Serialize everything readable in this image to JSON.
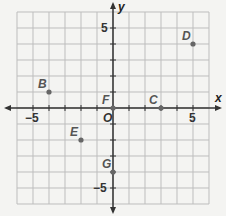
{
  "chart_data": {
    "type": "scatter",
    "title": "",
    "xlabel": "x",
    "ylabel": "y",
    "xlim": [
      -6,
      6
    ],
    "ylim": [
      -6,
      6
    ],
    "grid": true,
    "origin_label": "O",
    "x_tick_labels": [
      {
        "value": -5,
        "label": "−5"
      },
      {
        "value": 5,
        "label": "5"
      }
    ],
    "y_tick_labels": [
      {
        "value": 5,
        "label": "5"
      },
      {
        "value": -5,
        "label": "−5"
      }
    ],
    "points": [
      {
        "label": "B",
        "x": -4,
        "y": 1
      },
      {
        "label": "D",
        "x": 5,
        "y": 4
      },
      {
        "label": "F",
        "x": 0,
        "y": 0
      },
      {
        "label": "C",
        "x": 3,
        "y": 0
      },
      {
        "label": "E",
        "x": -2,
        "y": -2
      },
      {
        "label": "G",
        "x": 0,
        "y": -4
      }
    ],
    "colors": {
      "grid": "#bdbdbd",
      "axis": "#333333",
      "point": "#666666",
      "label": "#555555"
    }
  }
}
